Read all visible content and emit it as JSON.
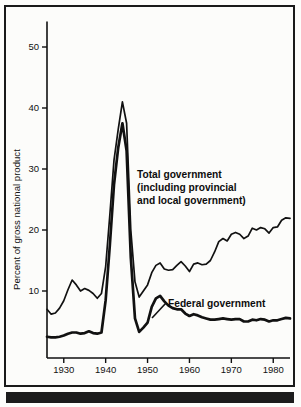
{
  "chart_data": {
    "type": "line",
    "title": "",
    "xlabel": "",
    "ylabel": "Percent of gross national product",
    "xlim": [
      1926,
      1984
    ],
    "ylim": [
      0,
      54
    ],
    "grid": false,
    "legend_position": "inline-annotation",
    "xticks": [
      1930,
      1940,
      1950,
      1960,
      1970,
      1980
    ],
    "xticklabels": [
      "1930",
      "1940",
      "1950",
      "1960",
      "1970",
      "1980"
    ],
    "yticks": [
      10,
      20,
      30,
      40,
      50
    ],
    "yticklabels": [
      "10",
      "20",
      "30",
      "40",
      "50"
    ],
    "annotations": [
      "Total government (including provincial and local government)",
      "Federal government"
    ],
    "series": [
      {
        "name": "Total government (including provincial and local government)",
        "x": [
          1926,
          1927,
          1928,
          1929,
          1930,
          1931,
          1932,
          1933,
          1934,
          1935,
          1936,
          1937,
          1938,
          1939,
          1940,
          1941,
          1942,
          1943,
          1944,
          1945,
          1946,
          1947,
          1948,
          1949,
          1950,
          1951,
          1952,
          1953,
          1954,
          1955,
          1956,
          1957,
          1958,
          1959,
          1960,
          1961,
          1962,
          1963,
          1964,
          1965,
          1966,
          1967,
          1968,
          1969,
          1970,
          1971,
          1972,
          1973,
          1974,
          1975,
          1976,
          1977,
          1978,
          1979,
          1980,
          1981,
          1982,
          1983,
          1984
        ],
        "values": [
          7.0,
          6.2,
          6.4,
          7.2,
          8.4,
          10.2,
          11.8,
          11.0,
          10.0,
          10.4,
          10.1,
          9.6,
          8.8,
          9.6,
          14.0,
          22.5,
          31.5,
          36.5,
          41.0,
          37.5,
          20.0,
          11.5,
          9.0,
          10.0,
          11.0,
          13.0,
          14.2,
          14.6,
          13.6,
          13.4,
          13.5,
          14.2,
          14.8,
          14.1,
          13.2,
          14.4,
          14.6,
          14.3,
          14.4,
          15.0,
          16.4,
          18.1,
          18.6,
          18.2,
          19.3,
          19.6,
          19.3,
          18.6,
          19.0,
          20.3,
          20.0,
          20.4,
          20.2,
          19.5,
          20.4,
          20.5,
          21.6,
          22.0,
          21.9
        ]
      },
      {
        "name": "Federal government",
        "x": [
          1926,
          1927,
          1928,
          1929,
          1930,
          1931,
          1932,
          1933,
          1934,
          1935,
          1936,
          1937,
          1938,
          1939,
          1940,
          1941,
          1942,
          1943,
          1944,
          1945,
          1946,
          1947,
          1948,
          1949,
          1950,
          1951,
          1952,
          1953,
          1954,
          1955,
          1956,
          1957,
          1958,
          1959,
          1960,
          1961,
          1962,
          1963,
          1964,
          1965,
          1966,
          1967,
          1968,
          1969,
          1970,
          1971,
          1972,
          1973,
          1974,
          1975,
          1976,
          1977,
          1978,
          1979,
          1980,
          1981,
          1982,
          1983,
          1984
        ],
        "values": [
          2.5,
          2.4,
          2.4,
          2.5,
          2.7,
          3.0,
          3.2,
          3.2,
          3.0,
          3.1,
          3.4,
          3.1,
          3.0,
          3.2,
          8.5,
          17.5,
          27.5,
          33.5,
          37.5,
          33.0,
          15.5,
          5.5,
          3.3,
          4.0,
          4.8,
          7.4,
          8.8,
          9.2,
          8.3,
          7.6,
          7.2,
          7.0,
          7.0,
          6.3,
          5.9,
          6.2,
          6.0,
          5.7,
          5.5,
          5.3,
          5.3,
          5.4,
          5.5,
          5.4,
          5.3,
          5.4,
          5.4,
          5.0,
          5.0,
          5.3,
          5.2,
          5.4,
          5.3,
          5.0,
          5.2,
          5.2,
          5.4,
          5.6,
          5.5
        ]
      }
    ]
  },
  "axes": {
    "y_axis_title": "Percent of gross national product"
  },
  "labels": {
    "total_line1": "Total government",
    "total_line2": "(including provincial",
    "total_line3": "and local government)",
    "federal": "Federal government"
  },
  "colors": {
    "ink": "#111111",
    "background": "#fcfcfa",
    "frame": "#1a1a1a",
    "bottom_bar": "#1c1c1c"
  }
}
